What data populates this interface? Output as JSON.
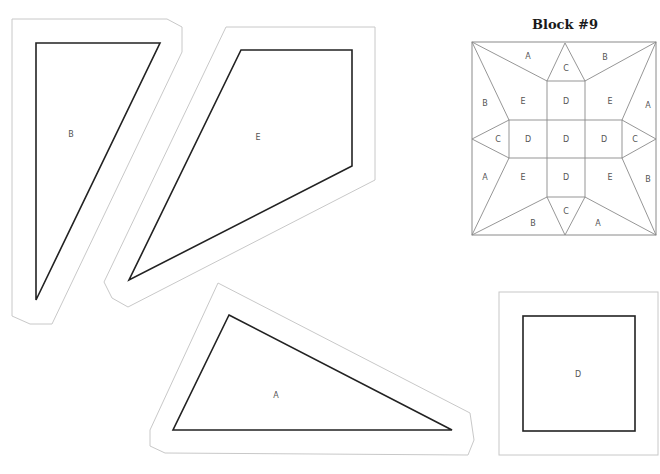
{
  "title": "Block #9",
  "colors": {
    "cut_line": "#c8c8c8",
    "sew_line": "#222222",
    "block_line": "#8a8a8a",
    "label": "#555555",
    "background": "#ffffff"
  },
  "templates": [
    {
      "id": "B",
      "label": "B",
      "shape": "triangle"
    },
    {
      "id": "E",
      "label": "E",
      "shape": "quadrilateral"
    },
    {
      "id": "A",
      "label": "A",
      "shape": "triangle"
    },
    {
      "id": "D",
      "label": "D",
      "shape": "square"
    }
  ],
  "block": {
    "labels": {
      "top_A": "A",
      "top_C": "C",
      "top_B": "B",
      "left_B": "B",
      "upper_left_E": "E",
      "upper_D": "D",
      "upper_right_E": "E",
      "right_A": "A",
      "left_C": "C",
      "left_D": "D",
      "center_D": "D",
      "right_D": "D",
      "right_C": "C",
      "left_A": "A",
      "lower_left_E": "E",
      "lower_D": "D",
      "lower_right_E": "E",
      "right_B": "B",
      "bottom_B": "B",
      "bottom_C": "C",
      "bottom_A": "A"
    }
  }
}
